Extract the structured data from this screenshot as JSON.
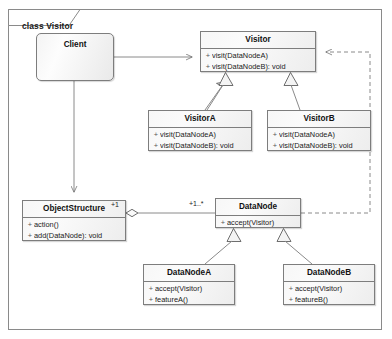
{
  "frame": {
    "label": "class Visitor",
    "kind": "uml-class-diagram-frame"
  },
  "classes": [
    {
      "id": "client",
      "name": "Client",
      "members": []
    },
    {
      "id": "visitor",
      "name": "Visitor",
      "members": [
        {
          "visibility": "+",
          "signature": "visit(DataNodeA)"
        },
        {
          "visibility": "+",
          "signature": "visit(DataNodeB): void"
        }
      ]
    },
    {
      "id": "visitorA",
      "name": "VisitorA",
      "members": [
        {
          "visibility": "+",
          "signature": "visit(DataNodeA)"
        },
        {
          "visibility": "+",
          "signature": "visit(DataNodeB): void"
        }
      ]
    },
    {
      "id": "visitorB",
      "name": "VisitorB",
      "members": [
        {
          "visibility": "+",
          "signature": "visit(DataNodeA)"
        },
        {
          "visibility": "+",
          "signature": "visit(DataNodeB): void"
        }
      ]
    },
    {
      "id": "objectStructure",
      "name": "ObjectStructure",
      "members": [
        {
          "visibility": "+",
          "signature": "action()"
        },
        {
          "visibility": "+",
          "signature": "add(DataNode): void"
        }
      ]
    },
    {
      "id": "dataNode",
      "name": "DataNode",
      "members": [
        {
          "visibility": "+",
          "signature": "accept(Visitor)"
        }
      ]
    },
    {
      "id": "dataNodeA",
      "name": "DataNodeA",
      "members": [
        {
          "visibility": "+",
          "signature": "accept(Visitor)"
        },
        {
          "visibility": "+",
          "signature": "featureA()"
        }
      ]
    },
    {
      "id": "dataNodeB",
      "name": "DataNodeB",
      "members": [
        {
          "visibility": "+",
          "signature": "accept(Visitor)"
        },
        {
          "visibility": "+",
          "signature": "featureB()"
        }
      ]
    }
  ],
  "edge_labels": {
    "objectStructure_multiplicity": "+1",
    "dataNode_multiplicity": "+1..*"
  },
  "relationships": [
    {
      "from": "Client",
      "to": "Visitor",
      "type": "association",
      "arrow": "open-arrow",
      "line": "solid"
    },
    {
      "from": "Client",
      "to": "ObjectStructure",
      "type": "association",
      "arrow": "open-arrow",
      "line": "solid"
    },
    {
      "from": "VisitorA",
      "to": "Visitor",
      "type": "generalization",
      "arrow": "hollow-triangle",
      "line": "solid"
    },
    {
      "from": "VisitorB",
      "to": "Visitor",
      "type": "generalization",
      "arrow": "hollow-triangle",
      "line": "solid"
    },
    {
      "from": "ObjectStructure",
      "to": "DataNode",
      "type": "aggregation",
      "arrow": "hollow-diamond",
      "line": "solid"
    },
    {
      "from": "DataNode",
      "to": "Visitor",
      "type": "dependency",
      "arrow": "open-arrow",
      "line": "dashed"
    },
    {
      "from": "DataNodeA",
      "to": "DataNode",
      "type": "generalization",
      "arrow": "hollow-triangle",
      "line": "solid"
    },
    {
      "from": "DataNodeB",
      "to": "DataNode",
      "type": "generalization",
      "arrow": "hollow-triangle",
      "line": "solid"
    }
  ],
  "colors": {
    "line": "#8a8a8a",
    "class_border": "#7d7d7d",
    "class_fill": "#f4f4f4",
    "text": "#111111",
    "background": "#ffffff"
  }
}
